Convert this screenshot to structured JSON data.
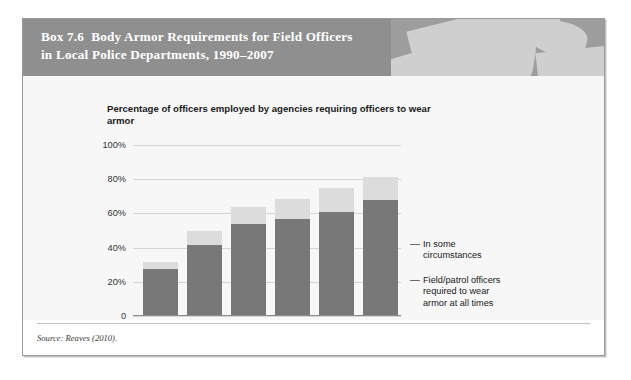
{
  "box": {
    "label": "Box 7.6",
    "title": "Body Armor Requirements for Field Officers in Local Police Departments, 1990–2007",
    "title_line1": "Body Armor Requirements for Field Officers",
    "title_line2": "in Local Police Departments, 1990–2007",
    "header_photo_alt": "police-officer-photo"
  },
  "source": {
    "text": "Source: Reaves (2010)."
  },
  "colors": {
    "header_band": "#8f8f8f",
    "chart_background": "#f7f7f7",
    "bar_bottom": "#787878",
    "bar_top": "#dcdcdc",
    "gridline": "#d5d5d5",
    "axis": "#8c8c8c",
    "border": "#9a9a9a"
  },
  "chart_data": {
    "type": "bar",
    "subtype": "stacked",
    "title": "Percentage of officers employed by agencies requiring officers to wear armor",
    "xlabel": "",
    "ylabel": "",
    "ylim": [
      0,
      100
    ],
    "yticks": [
      "0",
      "20%",
      "40%",
      "60%",
      "80%",
      "100%"
    ],
    "ytick_values": [
      0,
      20,
      40,
      60,
      80,
      100
    ],
    "grid": true,
    "legend_position": "right",
    "categories": [
      "1990",
      "1993",
      "1997",
      "2000",
      "2003",
      "2007"
    ],
    "series": [
      {
        "name": "Field/patrol officers required to wear armor at all times",
        "color": "#787878",
        "values": [
          27,
          41,
          53,
          56,
          60,
          67
        ]
      },
      {
        "name": "In some circumstances",
        "color": "#dcdcdc",
        "values": [
          4,
          8,
          10,
          12,
          14,
          14
        ]
      }
    ],
    "totals": [
      31,
      49,
      63,
      68,
      74,
      81
    ]
  },
  "legend": {
    "some": {
      "line1": "In some",
      "line2": "circumstances"
    },
    "all": {
      "line1": "Field/patrol officers",
      "line2": "required to wear",
      "line3": "armor at all times"
    }
  }
}
